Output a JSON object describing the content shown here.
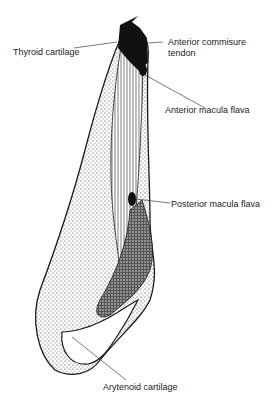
{
  "diagram": {
    "labels": {
      "thyroid_cartilage": "Thyroid cartilage",
      "anterior_commissure_1": "Anterior commisure",
      "anterior_commissure_2": "tendon",
      "anterior_macula_flava": "Anterior macula flava",
      "posterior_macula_flava": "Posterior macula flava",
      "arytenoid_cartilage": "Arytenoid cartilage"
    },
    "colors": {
      "ink": "#1a1a1a",
      "background": "#ffffff"
    }
  }
}
